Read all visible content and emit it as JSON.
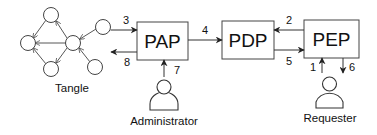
{
  "diagram": {
    "colors": {
      "stroke": "#333333",
      "fill": "#ffffff",
      "text": "#111111"
    },
    "boxes": {
      "pap": {
        "label": "PAP"
      },
      "pdp": {
        "label": "PDP"
      },
      "pep": {
        "label": "PEP"
      }
    },
    "actors": {
      "tangle": {
        "label": "Tangle"
      },
      "administrator": {
        "label": "Administrator"
      },
      "requester": {
        "label": "Requester"
      }
    },
    "edges": [
      {
        "id": "e1",
        "label": "1",
        "from": "Requester",
        "to": "PEP"
      },
      {
        "id": "e2",
        "label": "2",
        "from": "PEP",
        "to": "PDP"
      },
      {
        "id": "e3",
        "label": "3",
        "from": "Tangle",
        "to": "PAP"
      },
      {
        "id": "e4",
        "label": "4",
        "from": "PAP",
        "to": "PDP"
      },
      {
        "id": "e5",
        "label": "5",
        "from": "PDP",
        "to": "PEP"
      },
      {
        "id": "e6",
        "label": "6",
        "from": "PEP",
        "to": "Requester"
      },
      {
        "id": "e7",
        "label": "7",
        "from": "Administrator",
        "to": "PAP"
      },
      {
        "id": "e8",
        "label": "8",
        "from": "PAP",
        "to": "Tangle"
      }
    ]
  }
}
